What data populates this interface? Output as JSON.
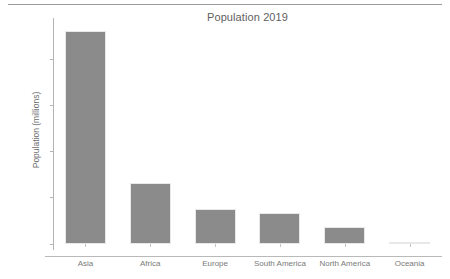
{
  "chart_data": {
    "type": "bar",
    "title": "Population 2019",
    "xlabel": "",
    "ylabel": "Population (millions)",
    "categories": [
      "Asia",
      "Africa",
      "Europe",
      "South America",
      "North America",
      "Oceania"
    ],
    "values": [
      4627,
      1319,
      757,
      670,
      368,
      42
    ],
    "series": [
      {
        "name": "Population 2019",
        "values": [
          4627,
          1319,
          757,
          670,
          368,
          42
        ]
      }
    ],
    "ylim": [
      0,
      4900
    ],
    "yticks": [
      0,
      1000,
      2000,
      3000,
      4000
    ],
    "ytick_labels": [
      "0",
      "1000",
      "2000",
      "3000",
      "4000"
    ],
    "grid": false,
    "legend": false,
    "bar_color": "#8b8b8b",
    "axis_color": "#b3b3b3",
    "text_color": "#7a7a7a"
  },
  "figure": {
    "top_rule": true,
    "background": "#ffffff"
  }
}
